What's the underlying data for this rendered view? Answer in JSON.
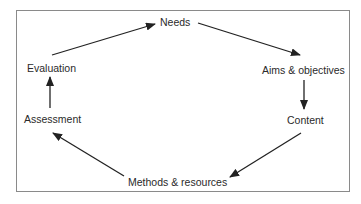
{
  "diagram": {
    "type": "cycle",
    "nodes": [
      {
        "id": "needs",
        "label": "Needs"
      },
      {
        "id": "aims",
        "label": "Aims & objectives"
      },
      {
        "id": "content",
        "label": "Content"
      },
      {
        "id": "methods",
        "label": "Methods & resources"
      },
      {
        "id": "assessment",
        "label": "Assessment"
      },
      {
        "id": "evaluation",
        "label": "Evaluation"
      }
    ],
    "edges": [
      {
        "from": "needs",
        "to": "aims"
      },
      {
        "from": "aims",
        "to": "content"
      },
      {
        "from": "content",
        "to": "methods"
      },
      {
        "from": "methods",
        "to": "assessment"
      },
      {
        "from": "assessment",
        "to": "evaluation"
      },
      {
        "from": "evaluation",
        "to": "needs"
      }
    ],
    "colors": {
      "arrow": "#222222",
      "border": "#8a8a8a",
      "text": "#2a2a2a"
    }
  }
}
